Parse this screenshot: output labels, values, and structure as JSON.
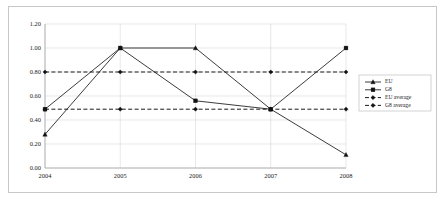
{
  "chart_data": {
    "type": "line",
    "title": "",
    "xlabel": "",
    "ylabel": "",
    "categories": [
      "2004",
      "2005",
      "2006",
      "2007",
      "2008"
    ],
    "ylim": [
      0.0,
      1.2
    ],
    "yticks": [
      "0.00",
      "0.20",
      "0.40",
      "0.60",
      "0.80",
      "1.00",
      "1.20"
    ],
    "ytick_values": [
      0.0,
      0.2,
      0.4,
      0.6,
      0.8,
      1.0,
      1.2
    ],
    "grid": true,
    "legend_position": "right",
    "series": [
      {
        "name": "EU",
        "style": "solid",
        "marker": "triangle",
        "values": [
          0.28,
          1.0,
          1.0,
          0.49,
          0.11
        ]
      },
      {
        "name": "G8",
        "style": "solid",
        "marker": "square",
        "values": [
          0.49,
          1.0,
          0.56,
          0.49,
          1.0
        ]
      },
      {
        "name": "EU average",
        "style": "dashed",
        "marker": "diamond",
        "values": [
          0.8,
          0.8,
          0.8,
          0.8,
          0.8
        ]
      },
      {
        "name": "G8 average",
        "style": "dashed",
        "marker": "diamond",
        "values": [
          0.49,
          0.49,
          0.49,
          0.49,
          0.49
        ]
      }
    ]
  },
  "legend": {
    "entries": [
      "EU",
      "G8",
      "EU average",
      "G8 average"
    ]
  },
  "colors": {
    "series_line": "#262626",
    "average_line": "#1a1a1a",
    "grid": "#d9d9d9",
    "axis": "#a6a6a6",
    "frame": "#c8c8c8",
    "background": "#ffffff",
    "text": "#1a1a1a"
  }
}
